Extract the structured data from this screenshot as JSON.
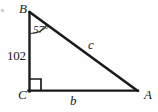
{
  "figure": {
    "kind": "right-triangle-diagram",
    "background_color": "#fefefe",
    "stroke_color": "#1a1a1a",
    "vertices": [
      {
        "name": "B",
        "label": "B",
        "x": 29,
        "y": 12,
        "label_position": "above-left"
      },
      {
        "name": "C",
        "label": "C",
        "x": 29,
        "y": 91,
        "label_position": "below-left"
      },
      {
        "name": "A",
        "label": "A",
        "x": 137,
        "y": 91,
        "label_position": "below-right"
      }
    ],
    "sides": [
      {
        "name": "BC",
        "label": "102",
        "label_style": "upright",
        "from": "B",
        "to": "C",
        "position": "left-vertical-leg"
      },
      {
        "name": "CA",
        "label": "b",
        "label_style": "italic",
        "from": "C",
        "to": "A",
        "position": "bottom-horizontal-leg"
      },
      {
        "name": "BA",
        "label": "c",
        "label_style": "italic",
        "from": "B",
        "to": "A",
        "position": "hypotenuse"
      }
    ],
    "angles": [
      {
        "at": "B",
        "label": "57°",
        "value": 57,
        "unit": "degrees",
        "marker": "arc"
      },
      {
        "at": "C",
        "label": "",
        "value": 90,
        "unit": "degrees",
        "marker": "right-angle-square"
      }
    ]
  }
}
